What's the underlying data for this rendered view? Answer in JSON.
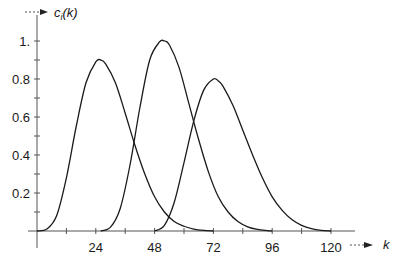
{
  "chart_data": {
    "type": "line",
    "title": "",
    "xlabel": "k",
    "ylabel": "c_i(k)",
    "xlim": [
      0,
      126
    ],
    "ylim": [
      0,
      1.05
    ],
    "x_ticks": [
      12,
      24,
      36,
      48,
      60,
      72,
      84,
      96,
      108,
      120
    ],
    "x_tick_labels": [
      "24",
      "48",
      "72",
      "96",
      "120"
    ],
    "x_tick_label_values": [
      24,
      48,
      72,
      96,
      120
    ],
    "y_ticks": [
      0.1,
      0.2,
      0.3,
      0.4,
      0.5,
      0.6,
      0.7,
      0.8,
      0.9,
      1.0
    ],
    "y_tick_labels": [
      "0.2",
      "0.4",
      "0.6",
      "0.8",
      "1."
    ],
    "y_tick_label_values": [
      0.2,
      0.4,
      0.6,
      0.8,
      1.0
    ],
    "grid": false,
    "legend": null,
    "series": [
      {
        "name": "c1(k)",
        "x": [
          0,
          4,
          8,
          12,
          16,
          20,
          24,
          26,
          28,
          32,
          36,
          40,
          44,
          48,
          52,
          56,
          60,
          64,
          68,
          72
        ],
        "values": [
          0,
          0.01,
          0.08,
          0.28,
          0.55,
          0.78,
          0.89,
          0.9,
          0.88,
          0.78,
          0.62,
          0.45,
          0.3,
          0.18,
          0.1,
          0.05,
          0.025,
          0.01,
          0.003,
          0
        ]
      },
      {
        "name": "c2(k)",
        "x": [
          26,
          30,
          34,
          38,
          42,
          46,
          50,
          52,
          54,
          58,
          62,
          66,
          70,
          74,
          78,
          82,
          86,
          90,
          94,
          96
        ],
        "values": [
          0,
          0.02,
          0.12,
          0.35,
          0.65,
          0.9,
          0.995,
          1.0,
          0.98,
          0.86,
          0.67,
          0.48,
          0.31,
          0.18,
          0.1,
          0.05,
          0.022,
          0.008,
          0.002,
          0
        ]
      },
      {
        "name": "c3(k)",
        "x": [
          48,
          52,
          56,
          60,
          64,
          68,
          72,
          74,
          76,
          80,
          84,
          88,
          92,
          96,
          100,
          104,
          108,
          112,
          116,
          120
        ],
        "values": [
          0,
          0.03,
          0.15,
          0.36,
          0.58,
          0.74,
          0.8,
          0.79,
          0.76,
          0.66,
          0.53,
          0.4,
          0.28,
          0.18,
          0.11,
          0.06,
          0.03,
          0.012,
          0.003,
          0
        ]
      }
    ]
  },
  "axes": {
    "x_label": "k",
    "y_label_main": "c",
    "y_label_sub": "i",
    "y_label_arg": "(k)"
  },
  "colors": {
    "line": "#1a1a1a",
    "axis": "#555555"
  }
}
